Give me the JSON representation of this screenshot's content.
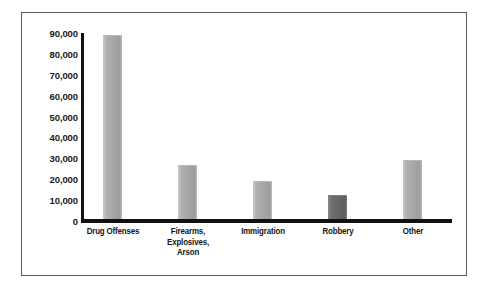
{
  "chart_data": {
    "type": "bar",
    "title": "",
    "subtitle": "",
    "xlabel": "",
    "ylabel": "",
    "categories": [
      "Drug Offenses",
      "Firearms, Explosives, Arson",
      "Immigration",
      "Robbery",
      "Other"
    ],
    "category_lines": [
      [
        "Drug Offenses"
      ],
      [
        "Firearms,",
        "Explosives,",
        "Arson"
      ],
      [
        "Immigration"
      ],
      [
        "Robbery"
      ],
      [
        "Other"
      ]
    ],
    "values": [
      88000,
      25800,
      18100,
      11400,
      28100
    ],
    "ylim": [
      0,
      90000
    ],
    "ytick_values": [
      0,
      10000,
      20000,
      30000,
      40000,
      50000,
      60000,
      70000,
      80000,
      90000
    ],
    "ytick_labels": [
      "0",
      "10,000",
      "20,000",
      "30,000",
      "40,000",
      "50,000",
      "60,000",
      "70,000",
      "80,000",
      "90,000"
    ],
    "grid": false,
    "legend": null,
    "legend_position": "none",
    "bar_colors": [
      "#a6a6a6",
      "#a6a6a6",
      "#a6a6a6",
      "#666666",
      "#a6a6a6"
    ],
    "highlight_category": "Robbery",
    "annotations": []
  },
  "style": {
    "axis_color": "#111111",
    "frame_color": "#5d5d5d",
    "background": "#ffffff",
    "text_color": "#141414",
    "bar_fill": "#a6a6a6",
    "bar_fill_dark": "#666666"
  }
}
